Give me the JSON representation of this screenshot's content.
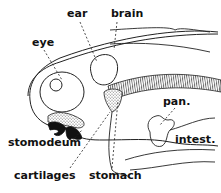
{
  "diagram": {
    "labels": {
      "ear": "ear",
      "brain": "brain",
      "eye": "eye",
      "pan": "pan.",
      "intest": "intest.",
      "stomodeum": "stomodeum",
      "cartilages": "cartilages",
      "stomach": "stomach"
    }
  }
}
